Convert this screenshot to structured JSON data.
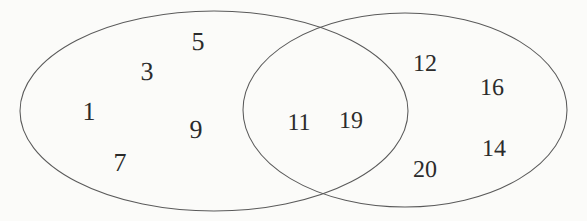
{
  "figure": {
    "type": "venn-diagram-two-set",
    "background_color": "#fbfbf9",
    "stroke_color": "#5a5a5a",
    "text_color": "#2b2b2b"
  },
  "sets": {
    "left_only": {
      "name": "left-ellipse-exclusive-region",
      "elements": [
        "5",
        "3",
        "1",
        "9",
        "7"
      ]
    },
    "intersection": {
      "name": "intersection-region",
      "elements": [
        "11",
        "19"
      ]
    },
    "right_only": {
      "name": "right-ellipse-exclusive-region",
      "elements": [
        "12",
        "16",
        "20",
        "14"
      ]
    }
  },
  "labels": [
    {
      "id": "label-5",
      "text": "5",
      "x": 198,
      "y": 42,
      "region": "left_only"
    },
    {
      "id": "label-3",
      "text": "3",
      "x": 147,
      "y": 72,
      "region": "left_only"
    },
    {
      "id": "label-1",
      "text": "1",
      "x": 89,
      "y": 112,
      "region": "left_only"
    },
    {
      "id": "label-9",
      "text": "9",
      "x": 196,
      "y": 130,
      "region": "left_only"
    },
    {
      "id": "label-7",
      "text": "7",
      "x": 120,
      "y": 163,
      "region": "left_only"
    },
    {
      "id": "label-11",
      "text": "11",
      "x": 299,
      "y": 123,
      "region": "intersection"
    },
    {
      "id": "label-19",
      "text": "19",
      "x": 351,
      "y": 121,
      "region": "intersection"
    },
    {
      "id": "label-12",
      "text": "12",
      "x": 425,
      "y": 64,
      "region": "right_only"
    },
    {
      "id": "label-16",
      "text": "16",
      "x": 492,
      "y": 88,
      "region": "right_only"
    },
    {
      "id": "label-20",
      "text": "20",
      "x": 425,
      "y": 170,
      "region": "right_only"
    },
    {
      "id": "label-14",
      "text": "14",
      "x": 494,
      "y": 149,
      "region": "right_only"
    }
  ],
  "ellipses": [
    {
      "id": "left-ellipse",
      "cx": 214,
      "cy": 111,
      "rx": 194,
      "ry": 100
    },
    {
      "id": "right-ellipse",
      "cx": 405,
      "cy": 110,
      "rx": 162,
      "ry": 97
    }
  ]
}
